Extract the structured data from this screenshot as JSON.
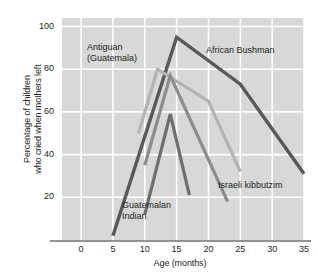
{
  "chart_data": {
    "type": "line",
    "title": "",
    "xlabel": "Age (months)",
    "ylabel": "Percentage of children who cried when mothers left",
    "ylabel_line1": "Percentage of children",
    "ylabel_line2": "who cried when mothers left",
    "xlim": [
      -3,
      35
    ],
    "ylim": [
      0,
      104
    ],
    "xticks": [
      0,
      5,
      10,
      15,
      20,
      25,
      30,
      35
    ],
    "yticks": [
      20,
      40,
      60,
      80,
      100
    ],
    "xtick_labels": [
      "0",
      "5",
      "10",
      "15",
      "20",
      "25",
      "30",
      "35"
    ],
    "ytick_labels": [
      "20",
      "40",
      "60",
      "80",
      "100"
    ],
    "grid": true,
    "grid_color": "#ffffff",
    "plot_background": "#d8d8d8",
    "legend": "in-plot annotations",
    "series": [
      {
        "name": "African Bushman",
        "color": "#58595b",
        "width": 3.4,
        "points": [
          [
            5,
            2
          ],
          [
            15,
            95
          ],
          [
            25,
            73
          ],
          [
            35,
            31
          ]
        ]
      },
      {
        "name": "Antiguan (Guatemala)",
        "color": "#b3b3b3",
        "width": 3.2,
        "points": [
          [
            9,
            50
          ],
          [
            12,
            80
          ],
          [
            20,
            65
          ],
          [
            25,
            32
          ]
        ]
      },
      {
        "name": "Israeli kibbutzim",
        "color": "#8c8c8e",
        "width": 3.2,
        "points": [
          [
            10,
            35
          ],
          [
            14,
            77
          ],
          [
            23,
            18
          ]
        ]
      },
      {
        "name": "Guatemalan Indian",
        "color": "#6d6e71",
        "width": 3.2,
        "points": [
          [
            10,
            12
          ],
          [
            14,
            59
          ],
          [
            17,
            21
          ]
        ]
      }
    ],
    "annotations": [
      {
        "text_line1": "Antiguan",
        "text_line2": "(Guatemala)",
        "x": 87,
        "y": 42
      },
      {
        "text_line1": "African Bushman",
        "text_line2": "",
        "x": 206,
        "y": 45
      },
      {
        "text_line1": "Israeli kibbutzim",
        "text_line2": "",
        "x": 218,
        "y": 180
      },
      {
        "text_line1": "Guatemalan",
        "text_line2": "Indian",
        "x": 122,
        "y": 200
      }
    ]
  },
  "axis": {
    "line_color": "#6d6e71"
  }
}
